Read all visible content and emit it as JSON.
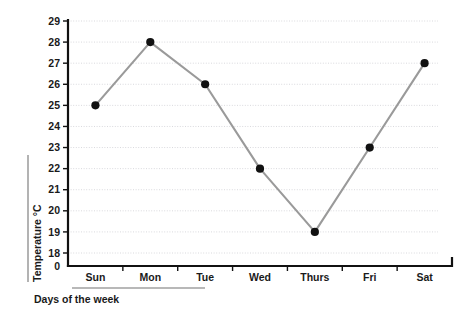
{
  "chart_data": {
    "type": "line",
    "title": "",
    "subtitle": "",
    "xlabel": "Days of the week",
    "ylabel": "Temperature  °C",
    "categories": [
      "Sun",
      "Mon",
      "Tue",
      "Wed",
      "Thurs",
      "Fri",
      "Sat"
    ],
    "values": [
      25,
      28,
      26,
      22,
      19,
      23,
      27
    ],
    "series": [
      {
        "name": "Temperature",
        "values": [
          25,
          28,
          26,
          22,
          19,
          23,
          27
        ]
      }
    ],
    "ytick_labels": [
      "29",
      "28",
      "27",
      "26",
      "25",
      "24",
      "23",
      "22",
      "21",
      "20",
      "19",
      "18",
      "0"
    ],
    "ytick_values": [
      29,
      28,
      27,
      26,
      25,
      24,
      23,
      22,
      21,
      20,
      19,
      18,
      0
    ],
    "ylim": [
      18,
      29
    ],
    "axis_break": true,
    "axis_break_label": "0",
    "grid": true,
    "grid_axis": "y",
    "legend": false,
    "legend_position": "none",
    "marker": "circle",
    "colors": {
      "line": "#9a9a9a",
      "marker": "#111111",
      "axis": "#111111",
      "grid": "#d9d9dd",
      "text": "#1a1a1a",
      "rule": "#a0a0a0",
      "background": "#ffffff"
    }
  },
  "axes": {
    "y_title": "Temperature  °C",
    "x_title": "Days of the week"
  },
  "points": [
    {
      "label": "Sun",
      "value": 25
    },
    {
      "label": "Mon",
      "value": 28
    },
    {
      "label": "Tue",
      "value": 26
    },
    {
      "label": "Wed",
      "value": 22
    },
    {
      "label": "Thurs",
      "value": 19
    },
    {
      "label": "Fri",
      "value": 23
    },
    {
      "label": "Sat",
      "value": 27
    }
  ]
}
